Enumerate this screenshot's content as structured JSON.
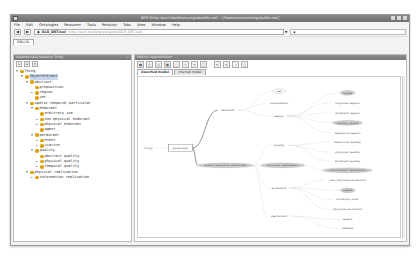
{
  "window": {
    "title": "BFO (http://purl.obolibrary.org/obo/bfo.owl) : [/home/user/ontologies/bfo.owl]",
    "controls": [
      "minimize",
      "maximize",
      "close"
    ]
  },
  "menubar": {
    "items": [
      "File",
      "Edit",
      "Ontologies",
      "Reasoner",
      "Tools",
      "Refactor",
      "Tabs",
      "View",
      "Window",
      "Help"
    ]
  },
  "addressbar": {
    "back": "◀",
    "forward": "▶",
    "ontology_name": "OLR_DRT.owl",
    "ontology_iri": "(http://purl.obolibrary.org/obo/OLR_DRT.owl)",
    "search_placeholder": "Search..."
  },
  "tabs": [
    {
      "label": "DNL/OL",
      "active": true
    }
  ],
  "left_panel": {
    "header": "Asserted class hierarchy: Thing",
    "header_right": "",
    "toolbar": [
      "add-subclass",
      "add-sibling",
      "delete"
    ],
    "tree": [
      {
        "depth": 0,
        "label": "Thing",
        "expanded": true
      },
      {
        "depth": 1,
        "label": "ObjectOrEvent",
        "expanded": true,
        "selected": true
      },
      {
        "depth": 2,
        "label": "abstract",
        "expanded": true
      },
      {
        "depth": 3,
        "label": "proposition",
        "expanded": null
      },
      {
        "depth": 3,
        "label": "region",
        "expanded": false
      },
      {
        "depth": 3,
        "label": "set",
        "expanded": null
      },
      {
        "depth": 2,
        "label": "spatio-temporal particular",
        "expanded": true
      },
      {
        "depth": 3,
        "label": "endurant",
        "expanded": true
      },
      {
        "depth": 4,
        "label": "arbitrary sum",
        "expanded": null
      },
      {
        "depth": 4,
        "label": "non-physical endurant",
        "expanded": false
      },
      {
        "depth": 4,
        "label": "physical endurant",
        "expanded": false
      },
      {
        "depth": 4,
        "label": "agent",
        "expanded": null
      },
      {
        "depth": 3,
        "label": "perdurant",
        "expanded": true
      },
      {
        "depth": 4,
        "label": "event",
        "expanded": false
      },
      {
        "depth": 4,
        "label": "stative",
        "expanded": false
      },
      {
        "depth": 3,
        "label": "quality",
        "expanded": true
      },
      {
        "depth": 4,
        "label": "abstract quality",
        "expanded": null
      },
      {
        "depth": 4,
        "label": "physical quality",
        "expanded": false
      },
      {
        "depth": 4,
        "label": "temporal quality",
        "expanded": false
      },
      {
        "depth": 2,
        "label": "physical realization",
        "expanded": true
      },
      {
        "depth": 3,
        "label": "information realization",
        "expanded": false
      }
    ]
  },
  "right_panel": {
    "header": "OWLViz: ObjectOrEvent",
    "toolbar": [
      "show-class",
      "show-subclasses",
      "show-superclasses",
      "show-all",
      "hide-class",
      "hide-all",
      "remove",
      "options",
      "zoom-in",
      "zoom-out",
      "export",
      "layout"
    ],
    "view_tabs": [
      {
        "label": "Asserted model",
        "active": true
      },
      {
        "label": "Inferred model",
        "active": false
      }
    ],
    "graph": {
      "nodes": [
        {
          "id": "thing",
          "label": "Thing",
          "x": 8,
          "y": 85,
          "shape": "text"
        },
        {
          "id": "particular",
          "label": "particular",
          "x": 34,
          "y": 85,
          "shape": "box"
        },
        {
          "id": "abstract",
          "label": "abstract",
          "x": 72,
          "y": 40,
          "shape": "text"
        },
        {
          "id": "set",
          "label": "set",
          "x": 113,
          "y": 17,
          "shape": "ellipse-outline"
        },
        {
          "id": "proposition",
          "label": "proposition",
          "x": 113,
          "y": 32,
          "shape": "text"
        },
        {
          "id": "region",
          "label": "region",
          "x": 113,
          "y": 47,
          "shape": "text"
        },
        {
          "id": "quale",
          "label": "quale",
          "x": 168,
          "y": 19,
          "shape": "ellipse"
        },
        {
          "id": "physical-region",
          "label": "physical region",
          "x": 168,
          "y": 31,
          "shape": "text"
        },
        {
          "id": "abstract-region",
          "label": "abstract region",
          "x": 168,
          "y": 43,
          "shape": "text"
        },
        {
          "id": "quality-space",
          "label": "quality space",
          "x": 168,
          "y": 55,
          "shape": "ellipse"
        },
        {
          "id": "temporal-region",
          "label": "temporal region",
          "x": 168,
          "y": 67,
          "shape": "text"
        },
        {
          "id": "quality",
          "label": "quality",
          "x": 113,
          "y": 82,
          "shape": "text"
        },
        {
          "id": "temporal-quality",
          "label": "temporal quality",
          "x": 168,
          "y": 78,
          "shape": "text"
        },
        {
          "id": "physical-quality",
          "label": "physical quality",
          "x": 168,
          "y": 90,
          "shape": "text"
        },
        {
          "id": "abstract-quality",
          "label": "abstract quality",
          "x": 168,
          "y": 101,
          "shape": "text"
        },
        {
          "id": "spatio-temporal",
          "label": "spatio-temporal particular",
          "x": 70,
          "y": 106,
          "shape": "ellipse"
        },
        {
          "id": "physical-realization",
          "label": "physical realization",
          "x": 116,
          "y": 106,
          "shape": "ellipse"
        },
        {
          "id": "information-realization",
          "label": "information realization",
          "x": 168,
          "y": 112,
          "shape": "ellipse"
        },
        {
          "id": "endurant",
          "label": "endurant",
          "x": 113,
          "y": 133,
          "shape": "text"
        },
        {
          "id": "non-physical-endurant",
          "label": "non-physical endurant",
          "x": 168,
          "y": 124,
          "shape": "text"
        },
        {
          "id": "agent",
          "label": "agent",
          "x": 168,
          "y": 136,
          "shape": "ellipse"
        },
        {
          "id": "arbitrary-sum",
          "label": "arbitrary sum",
          "x": 168,
          "y": 147,
          "shape": "text"
        },
        {
          "id": "physical-endurant",
          "label": "physical endurant",
          "x": 168,
          "y": 159,
          "shape": "text"
        },
        {
          "id": "perdurant",
          "label": "perdurant",
          "x": 113,
          "y": 167,
          "shape": "text"
        },
        {
          "id": "event",
          "label": "event",
          "x": 168,
          "y": 171,
          "shape": "text"
        },
        {
          "id": "stative",
          "label": "stative",
          "x": 168,
          "y": 182,
          "shape": "text"
        }
      ],
      "edges": [
        [
          "thing",
          "particular"
        ],
        [
          "particular",
          "abstract"
        ],
        [
          "particular",
          "spatio-temporal"
        ],
        [
          "abstract",
          "set"
        ],
        [
          "abstract",
          "proposition"
        ],
        [
          "abstract",
          "region"
        ],
        [
          "region",
          "quale"
        ],
        [
          "region",
          "physical-region"
        ],
        [
          "region",
          "abstract-region"
        ],
        [
          "region",
          "quality-space"
        ],
        [
          "region",
          "temporal-region"
        ],
        [
          "spatio-temporal",
          "quality"
        ],
        [
          "quality",
          "temporal-quality"
        ],
        [
          "quality",
          "physical-quality"
        ],
        [
          "quality",
          "abstract-quality"
        ],
        [
          "spatio-temporal",
          "physical-realization"
        ],
        [
          "physical-realization",
          "information-realization"
        ],
        [
          "spatio-temporal",
          "endurant"
        ],
        [
          "endurant",
          "non-physical-endurant"
        ],
        [
          "endurant",
          "agent"
        ],
        [
          "endurant",
          "arbitrary-sum"
        ],
        [
          "endurant",
          "physical-endurant"
        ],
        [
          "spatio-temporal",
          "perdurant"
        ],
        [
          "perdurant",
          "event"
        ],
        [
          "perdurant",
          "stative"
        ]
      ]
    }
  }
}
